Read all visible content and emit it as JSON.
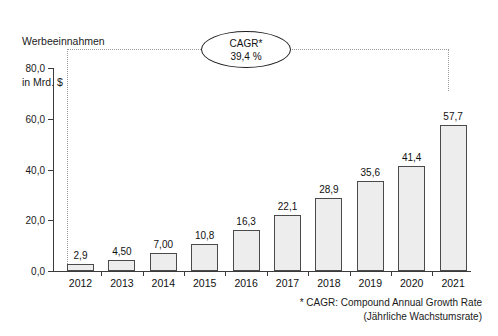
{
  "chart_data": {
    "type": "bar",
    "title": "Werbeeinnahmen in Mrd. $",
    "ylabel_lines": [
      "Werbeeinnahmen",
      "in Mrd. $"
    ],
    "xlabel": "",
    "ylabel": "Werbeeinnahmen in Mrd. $",
    "categories": [
      "2012",
      "2013",
      "2014",
      "2015",
      "2016",
      "2017",
      "2018",
      "2019",
      "2020",
      "2021"
    ],
    "values": [
      2.9,
      4.5,
      7.0,
      10.8,
      16.3,
      22.1,
      28.9,
      35.6,
      41.4,
      57.7
    ],
    "value_labels": [
      "2,9",
      "4,50",
      "7,00",
      "10,8",
      "16,3",
      "22,1",
      "28,9",
      "35,6",
      "41,4",
      "57,7"
    ],
    "ylim": [
      0,
      80
    ],
    "yticks": [
      0,
      20,
      40,
      60,
      80
    ],
    "ytick_labels": [
      "0,0",
      "20,0",
      "40,0",
      "60,0",
      "80,0"
    ],
    "grid": false,
    "legend": null,
    "annotations": [
      {
        "name": "cagr-callout",
        "line1": "CAGR*",
        "line2": "39,4 %",
        "value": 39.4,
        "unit": "%",
        "spans_from": "2012",
        "spans_to": "2021"
      }
    ],
    "footnote_lines": [
      "* CAGR: Compound Annual Growth Rate",
      "(Jährliche Wachstumsrate)"
    ],
    "colors": {
      "bar_fill": "#ededed",
      "bar_border": "#4a4a4a",
      "axis": "#3b3b3b",
      "text": "#111111",
      "dotted_guide": "#9a9a9a",
      "background": "#ffffff"
    }
  }
}
